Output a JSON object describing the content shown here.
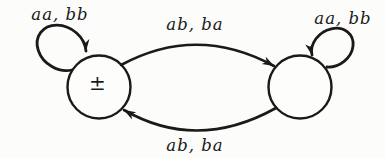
{
  "page": {
    "background": "#fcfcfb",
    "ink": "#1a1a1a"
  },
  "automaton": {
    "type": "two-state finite automaton diagram",
    "states": [
      {
        "id": "left",
        "label": "±"
      },
      {
        "id": "right",
        "label": ""
      }
    ],
    "transitions": [
      {
        "from": "left",
        "to": "left",
        "label": "aa, bb",
        "shape": "self-loop-top-left"
      },
      {
        "from": "right",
        "to": "right",
        "label": "aa, bb",
        "shape": "self-loop-top-right"
      },
      {
        "from": "left",
        "to": "right",
        "label": "ab, ba",
        "shape": "arc-top"
      },
      {
        "from": "right",
        "to": "left",
        "label": "ab, ba",
        "shape": "arc-bottom"
      }
    ]
  }
}
